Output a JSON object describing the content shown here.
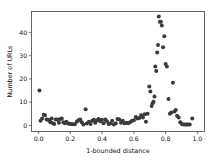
{
  "chart_data": {
    "type": "scatter",
    "title": "",
    "xlabel": "1-bounded distance",
    "ylabel": "Number of URLs",
    "xlim": [
      -0.045,
      1.045
    ],
    "ylim": [
      -2.6,
      49.0
    ],
    "xticks": [
      0.0,
      0.2,
      0.4,
      0.6,
      0.8,
      1.0
    ],
    "xticklabels": [
      "0.0",
      "0.2",
      "0.4",
      "0.6",
      "0.8",
      "1.0"
    ],
    "yticks": [
      0,
      10,
      20,
      30,
      40
    ],
    "yticklabels": [
      "0",
      "10",
      "20",
      "30",
      "40"
    ],
    "grid": false,
    "legend": null,
    "marker": "circle",
    "marker_color": "#3a3a3a",
    "marker_size": 2.0,
    "points": [
      {
        "x": 0.005,
        "y": 15.0
      },
      {
        "x": 0.012,
        "y": 2.0
      },
      {
        "x": 0.022,
        "y": 3.0
      },
      {
        "x": 0.032,
        "y": 4.6
      },
      {
        "x": 0.04,
        "y": 4.4
      },
      {
        "x": 0.05,
        "y": 2.6
      },
      {
        "x": 0.058,
        "y": 2.4
      },
      {
        "x": 0.066,
        "y": 2.2
      },
      {
        "x": 0.074,
        "y": 1.4
      },
      {
        "x": 0.082,
        "y": 3.0
      },
      {
        "x": 0.09,
        "y": 1.0
      },
      {
        "x": 0.098,
        "y": 0.6
      },
      {
        "x": 0.108,
        "y": 2.6
      },
      {
        "x": 0.118,
        "y": 2.6
      },
      {
        "x": 0.128,
        "y": 1.2
      },
      {
        "x": 0.137,
        "y": 2.8
      },
      {
        "x": 0.146,
        "y": 3.0
      },
      {
        "x": 0.156,
        "y": 1.4
      },
      {
        "x": 0.165,
        "y": 1.0
      },
      {
        "x": 0.175,
        "y": 1.6
      },
      {
        "x": 0.185,
        "y": 0.8
      },
      {
        "x": 0.196,
        "y": 0.6
      },
      {
        "x": 0.206,
        "y": 0.6
      },
      {
        "x": 0.216,
        "y": 0.5
      },
      {
        "x": 0.228,
        "y": 0.5
      },
      {
        "x": 0.24,
        "y": 1.6
      },
      {
        "x": 0.25,
        "y": 2.2
      },
      {
        "x": 0.262,
        "y": 2.6
      },
      {
        "x": 0.272,
        "y": 1.4
      },
      {
        "x": 0.282,
        "y": 0.4
      },
      {
        "x": 0.296,
        "y": 7.0
      },
      {
        "x": 0.303,
        "y": 0.8
      },
      {
        "x": 0.316,
        "y": 1.6
      },
      {
        "x": 0.327,
        "y": 0.6
      },
      {
        "x": 0.338,
        "y": 2.0
      },
      {
        "x": 0.348,
        "y": 2.4
      },
      {
        "x": 0.357,
        "y": 1.2
      },
      {
        "x": 0.368,
        "y": 2.2
      },
      {
        "x": 0.378,
        "y": 2.8
      },
      {
        "x": 0.388,
        "y": 1.8
      },
      {
        "x": 0.398,
        "y": 2.4
      },
      {
        "x": 0.409,
        "y": 1.0
      },
      {
        "x": 0.42,
        "y": 2.6
      },
      {
        "x": 0.43,
        "y": 1.8
      },
      {
        "x": 0.441,
        "y": 0.6
      },
      {
        "x": 0.452,
        "y": 0.8
      },
      {
        "x": 0.463,
        "y": 2.0
      },
      {
        "x": 0.474,
        "y": 0.4
      },
      {
        "x": 0.486,
        "y": 1.0
      },
      {
        "x": 0.497,
        "y": 2.8
      },
      {
        "x": 0.508,
        "y": 2.6
      },
      {
        "x": 0.519,
        "y": 1.2
      },
      {
        "x": 0.53,
        "y": 2.0
      },
      {
        "x": 0.541,
        "y": 1.0
      },
      {
        "x": 0.553,
        "y": 1.2
      },
      {
        "x": 0.564,
        "y": 1.0
      },
      {
        "x": 0.576,
        "y": 1.4
      },
      {
        "x": 0.588,
        "y": 2.0
      },
      {
        "x": 0.6,
        "y": 2.2
      },
      {
        "x": 0.612,
        "y": 3.6
      },
      {
        "x": 0.622,
        "y": 3.0
      },
      {
        "x": 0.634,
        "y": 3.2
      },
      {
        "x": 0.646,
        "y": 4.4
      },
      {
        "x": 0.657,
        "y": 3.4
      },
      {
        "x": 0.668,
        "y": 4.8
      },
      {
        "x": 0.676,
        "y": 1.6
      },
      {
        "x": 0.686,
        "y": 5.0
      },
      {
        "x": 0.697,
        "y": 16.8
      },
      {
        "x": 0.704,
        "y": 14.6
      },
      {
        "x": 0.712,
        "y": 8.4
      },
      {
        "x": 0.718,
        "y": 9.6
      },
      {
        "x": 0.724,
        "y": 10.2
      },
      {
        "x": 0.73,
        "y": 12.4
      },
      {
        "x": 0.735,
        "y": 25.4
      },
      {
        "x": 0.741,
        "y": 23.4
      },
      {
        "x": 0.747,
        "y": 31.4
      },
      {
        "x": 0.752,
        "y": 34.6
      },
      {
        "x": 0.757,
        "y": 46.8
      },
      {
        "x": 0.764,
        "y": 44.6
      },
      {
        "x": 0.77,
        "y": 44.6
      },
      {
        "x": 0.776,
        "y": 43.0
      },
      {
        "x": 0.784,
        "y": 33.6
      },
      {
        "x": 0.792,
        "y": 38.4
      },
      {
        "x": 0.8,
        "y": 26.4
      },
      {
        "x": 0.808,
        "y": 25.4
      },
      {
        "x": 0.818,
        "y": 11.4
      },
      {
        "x": 0.827,
        "y": 5.0
      },
      {
        "x": 0.836,
        "y": 5.6
      },
      {
        "x": 0.846,
        "y": 18.4
      },
      {
        "x": 0.856,
        "y": 6.0
      },
      {
        "x": 0.864,
        "y": 6.6
      },
      {
        "x": 0.872,
        "y": 4.2
      },
      {
        "x": 0.882,
        "y": 3.4
      },
      {
        "x": 0.892,
        "y": 1.4
      },
      {
        "x": 0.902,
        "y": 0.6
      },
      {
        "x": 0.912,
        "y": 0.4
      },
      {
        "x": 0.922,
        "y": 0.4
      },
      {
        "x": 0.932,
        "y": 0.4
      },
      {
        "x": 0.942,
        "y": 0.4
      },
      {
        "x": 0.952,
        "y": 0.4
      },
      {
        "x": 0.968,
        "y": 3.0
      }
    ]
  }
}
